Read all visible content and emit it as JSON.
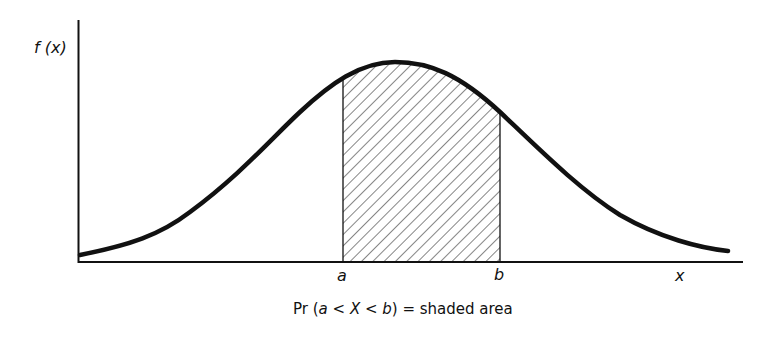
{
  "diagram": {
    "y_axis_label": "f (x)",
    "x_axis_label": "x",
    "bound_a_label": "a",
    "bound_b_label": "b",
    "caption": {
      "prefix": "Pr (",
      "a": "a",
      "lt1": " < ",
      "X": "X",
      "lt2": " < ",
      "b": "b",
      "suffix": ") = shaded area"
    },
    "curve": "bell-shaped probability density",
    "shaded_region": "area under curve between a and b (hatched)",
    "colors": {
      "stroke": "#111111",
      "hatch": "#333333",
      "background": "#ffffff"
    }
  }
}
